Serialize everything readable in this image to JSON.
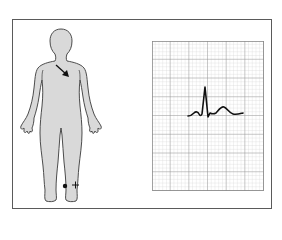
{
  "diagram": {
    "type": "ECG lead placement illustration",
    "figure": {
      "description": "Front view human body silhouette",
      "fill_color": "#d9d9d9",
      "outline_color": "#3a3a3a",
      "heart_vector_arrow": "arrow pointing down-right across chest",
      "electrode": {
        "location": "right side of left lower leg near ankle",
        "marker": "filled dot",
        "polarity_label": "+"
      }
    },
    "ecg_strip": {
      "grid_minor_color": "#c8c8c8",
      "grid_major_color": "#8a8a8a",
      "trace_color": "#111111",
      "waveform": "single PQRST complex with upright P wave, tall R wave, small S, upright T wave"
    },
    "frame_color": "#5a5a5a"
  }
}
